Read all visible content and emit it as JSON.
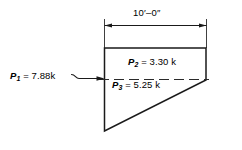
{
  "figure": {
    "type": "engineering-load-diagram",
    "background_color": "#ffffff",
    "line_color": "#1a1a1a"
  },
  "dimension": {
    "name": "overall-width",
    "label": "10′–0″",
    "feet": 10,
    "inches": 0,
    "units": "ft-in",
    "arrow_style": "tick-arrow-both-ends"
  },
  "loads": [
    {
      "id": "P1",
      "symbol": "P",
      "subscript": "1",
      "equals": "=",
      "value": "7.88",
      "unit": "k",
      "label": "P₁ = 7.88 k",
      "position": "left-exterior",
      "leader": "squiggle-arrow-pointing-right"
    },
    {
      "id": "P2",
      "symbol": "P",
      "subscript": "2",
      "equals": "=",
      "value": "3.30",
      "unit": "k",
      "label": "P₂ = 3.30 k",
      "position": "upper-interior"
    },
    {
      "id": "P3",
      "symbol": "P",
      "subscript": "3",
      "equals": "=",
      "value": "5.25",
      "unit": "k",
      "label": "P₃ = 5.25 k",
      "position": "lower-interior"
    }
  ],
  "shape": {
    "name": "pressure-trapezoid",
    "vertices": "top-left, top-right, right-mid, bottom-left",
    "centerline": "dashed-horizontal"
  }
}
